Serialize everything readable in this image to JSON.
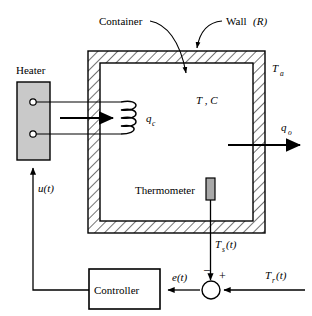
{
  "diagram": {
    "colors": {
      "line": "#000000",
      "heater_fill": "#c9c9c9",
      "thermometer_fill": "#a8a8a8",
      "wall_fill": "#ffffff",
      "background": "#ffffff"
    },
    "labels": {
      "container": "Container",
      "wall": "Wall",
      "wall_param": "(R)",
      "heater": "Heater",
      "thermometer": "Thermometer",
      "controller": "Controller",
      "ambient_temp": "T",
      "ambient_temp_sub": "a",
      "inside_state": "T , C",
      "heat_in": "q",
      "heat_in_sub": "c",
      "heat_out": "q",
      "heat_out_sub": "o",
      "control_signal": "u(t)",
      "sensor_signal": "T",
      "sensor_signal_sub": "s",
      "sensor_signal_tail": "(t)",
      "error_signal": "e(t)",
      "reference_signal": "T",
      "reference_signal_sub": "r",
      "reference_signal_tail": "(t)",
      "sum_minus": "–",
      "sum_plus": "+"
    },
    "icons": {
      "arrow_heat_in": "arrow-right-icon",
      "arrow_heat_out": "arrow-right-icon",
      "arrow_sensor": "arrow-down-icon",
      "arrow_feedback": "arrow-up-icon",
      "arrow_reference": "arrow-left-icon",
      "arrow_error": "arrow-left-icon",
      "leader_container": "leader-line-icon",
      "leader_wall": "leader-line-icon"
    }
  }
}
